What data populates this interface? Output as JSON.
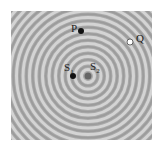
{
  "figure": {
    "background_color": "#a9a9a9",
    "ring_light_color": "#d4d4d4",
    "ring_dark_color": "#8f8f8f",
    "ring_spacing_px": 6.5,
    "center": {
      "x": 77,
      "y": 65
    }
  },
  "points": [
    {
      "id": "P",
      "label": "P",
      "sub": "",
      "fill": "#111111",
      "x": 70,
      "y": 20,
      "r": 3,
      "label_dx": -10,
      "label_dy": -8
    },
    {
      "id": "Q",
      "label": "Q",
      "sub": "",
      "fill": "#ffffff",
      "x": 119,
      "y": 31,
      "r": 3,
      "label_dx": 6,
      "label_dy": -9
    },
    {
      "id": "S1",
      "label": "S",
      "sub": "1",
      "fill": "#111111",
      "x": 62,
      "y": 65,
      "r": 3,
      "label_dx": -9,
      "label_dy": -14
    },
    {
      "id": "S2",
      "label": "S",
      "sub": "2",
      "fill": "#666666",
      "x": 77,
      "y": 65,
      "r": 3.5,
      "label_dx": 2,
      "label_dy": -15
    }
  ]
}
